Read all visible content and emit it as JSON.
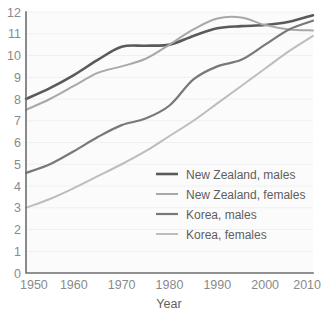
{
  "chart_data": {
    "type": "line",
    "title": "",
    "xlabel": "Year",
    "ylabel": "",
    "xlim": [
      1950,
      2010
    ],
    "ylim": [
      0,
      12
    ],
    "grid": true,
    "legend_position": "center-right",
    "x_ticks": [
      "1950",
      "1960",
      "1970",
      "1980",
      "1990",
      "2000",
      "2010"
    ],
    "y_ticks": [
      "0",
      "1",
      "2",
      "3",
      "4",
      "5",
      "6",
      "7",
      "8",
      "9",
      "10",
      "11",
      "12"
    ],
    "x": [
      1950,
      1955,
      1960,
      1965,
      1970,
      1975,
      1980,
      1985,
      1990,
      1995,
      2000,
      2005,
      2010
    ],
    "series": [
      {
        "name": "New Zealand, males",
        "color": "#5a5a5a",
        "width": 2.6,
        "values": [
          8.0,
          8.5,
          9.1,
          9.8,
          10.4,
          10.45,
          10.5,
          10.9,
          11.25,
          11.35,
          11.4,
          11.55,
          11.85
        ]
      },
      {
        "name": "New Zealand, females",
        "color": "#a8a8a8",
        "width": 2.0,
        "values": [
          7.5,
          8.0,
          8.6,
          9.2,
          9.5,
          9.85,
          10.5,
          11.2,
          11.7,
          11.75,
          11.4,
          11.2,
          11.15
        ]
      },
      {
        "name": "Korea, males",
        "color": "#787878",
        "width": 2.2,
        "values": [
          4.6,
          5.0,
          5.6,
          6.25,
          6.8,
          7.1,
          7.7,
          8.9,
          9.5,
          9.8,
          10.5,
          11.2,
          11.6
        ]
      },
      {
        "name": "Korea, females",
        "color": "#bdbdbd",
        "width": 2.0,
        "values": [
          3.0,
          3.4,
          3.9,
          4.45,
          5.0,
          5.6,
          6.3,
          7.0,
          7.8,
          8.6,
          9.4,
          10.2,
          10.9
        ]
      }
    ]
  },
  "legend": {
    "items": [
      {
        "label": "New Zealand, males"
      },
      {
        "label": "New Zealand, females"
      },
      {
        "label": "Korea, males"
      },
      {
        "label": "Korea, females"
      }
    ]
  }
}
